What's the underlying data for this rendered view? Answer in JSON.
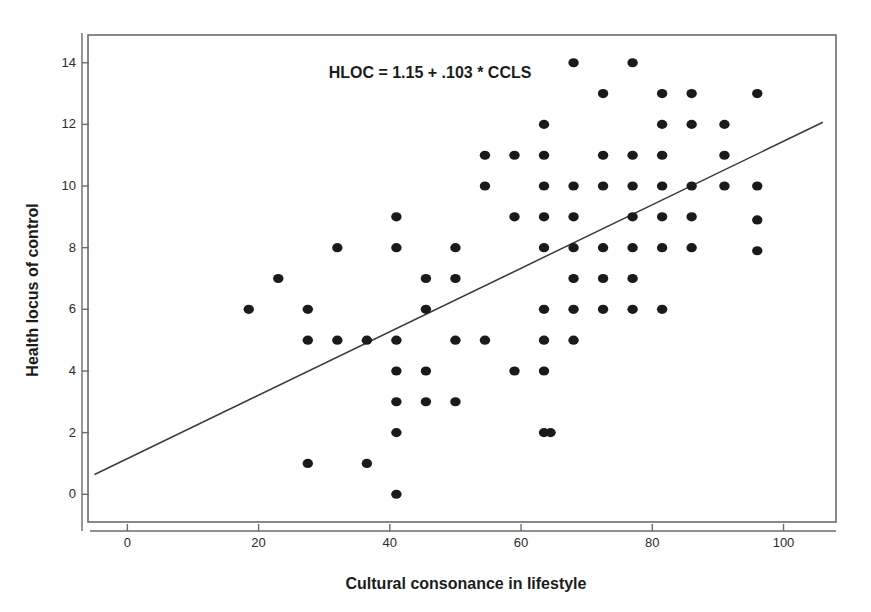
{
  "chart_data": {
    "type": "scatter",
    "title": "",
    "xlabel": "Cultural consonance in lifestyle",
    "ylabel": "Health locus of control",
    "annotation": "HLOC = 1.15 + .103 * CCLS",
    "xlim": [
      -6,
      108
    ],
    "ylim": [
      -0.9,
      14.9
    ],
    "xticks": [
      0,
      20,
      40,
      60,
      80,
      100
    ],
    "xtick_labels": [
      "0",
      "20",
      "40",
      "60",
      "80",
      "100"
    ],
    "yticks": [
      0,
      2,
      4,
      6,
      8,
      10,
      12,
      14
    ],
    "ytick_labels": [
      "0",
      "2",
      "4",
      "6",
      "8",
      "10",
      "12",
      "14"
    ],
    "grid": false,
    "legend": null,
    "marker": {
      "shape": "circle",
      "color": "#1a1a1a",
      "size": 6
    },
    "fit_line": {
      "kind": "linear-regression",
      "equation": "HLOC = 1.15 + .103 * CCLS",
      "intercept": 1.15,
      "slope": 0.103,
      "color": "#3a3a3a",
      "x_start": -5.0,
      "x_end": 106.0,
      "y_start": 0.64,
      "y_end": 12.07
    },
    "points": [
      [
        18.5,
        6
      ],
      [
        23,
        7
      ],
      [
        27.5,
        6
      ],
      [
        27.5,
        5
      ],
      [
        27.5,
        1
      ],
      [
        32,
        8
      ],
      [
        32,
        5
      ],
      [
        36.5,
        5
      ],
      [
        36.5,
        1
      ],
      [
        41,
        9
      ],
      [
        41,
        8
      ],
      [
        41,
        5
      ],
      [
        41,
        4
      ],
      [
        41,
        3
      ],
      [
        41,
        2
      ],
      [
        41,
        0
      ],
      [
        45.5,
        7
      ],
      [
        45.5,
        6
      ],
      [
        45.5,
        4
      ],
      [
        45.5,
        3
      ],
      [
        50,
        8
      ],
      [
        50,
        7
      ],
      [
        50,
        5
      ],
      [
        50,
        3
      ],
      [
        54.5,
        11
      ],
      [
        54.5,
        10
      ],
      [
        54.5,
        5
      ],
      [
        59,
        11
      ],
      [
        59,
        9
      ],
      [
        59,
        4
      ],
      [
        63.5,
        12
      ],
      [
        63.5,
        11
      ],
      [
        63.5,
        10
      ],
      [
        63.5,
        9
      ],
      [
        63.5,
        8
      ],
      [
        63.5,
        6
      ],
      [
        63.5,
        5
      ],
      [
        63.5,
        4
      ],
      [
        63.5,
        2
      ],
      [
        64.5,
        2
      ],
      [
        68,
        14
      ],
      [
        68,
        10
      ],
      [
        68,
        9
      ],
      [
        68,
        8
      ],
      [
        68,
        7
      ],
      [
        68,
        6
      ],
      [
        68,
        5
      ],
      [
        72.5,
        13
      ],
      [
        72.5,
        11
      ],
      [
        72.5,
        10
      ],
      [
        72.5,
        8
      ],
      [
        72.5,
        7
      ],
      [
        72.5,
        6
      ],
      [
        77,
        14
      ],
      [
        77,
        11
      ],
      [
        77,
        10
      ],
      [
        77,
        9
      ],
      [
        77,
        8
      ],
      [
        77,
        7
      ],
      [
        77,
        6
      ],
      [
        81.5,
        13
      ],
      [
        81.5,
        12
      ],
      [
        81.5,
        11
      ],
      [
        81.5,
        10
      ],
      [
        81.5,
        9
      ],
      [
        81.5,
        8
      ],
      [
        81.5,
        6
      ],
      [
        86,
        13
      ],
      [
        86,
        12
      ],
      [
        86,
        10
      ],
      [
        86,
        9
      ],
      [
        86,
        8
      ],
      [
        91,
        12
      ],
      [
        91,
        11
      ],
      [
        91,
        10
      ],
      [
        96,
        13
      ],
      [
        96,
        10
      ],
      [
        96,
        8.9
      ],
      [
        96,
        7.9
      ]
    ]
  },
  "axes": {
    "x_axis_name": "x-axis",
    "y_axis_name": "y-axis"
  }
}
